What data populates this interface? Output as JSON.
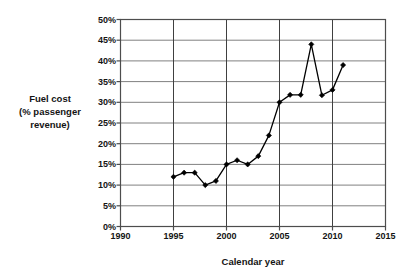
{
  "chart_data": {
    "type": "line",
    "title": "",
    "xlabel": "Calendar year",
    "ylabel": "Fuel cost\n(% passenger\nrevenue)",
    "ylabel_lines": [
      "Fuel cost",
      "(% passenger",
      "revenue)"
    ],
    "xlim": [
      1990,
      2015
    ],
    "ylim": [
      0,
      50
    ],
    "grid": true,
    "legend": "none",
    "x_tick_labels": [
      "1990",
      "1995",
      "2000",
      "2005",
      "2010",
      "2015"
    ],
    "x_ticks": [
      1990,
      1995,
      2000,
      2005,
      2010,
      2015
    ],
    "y_tick_labels": [
      "0%",
      "5%",
      "10%",
      "15%",
      "20%",
      "25%",
      "30%",
      "35%",
      "40%",
      "45%",
      "50%"
    ],
    "y_ticks": [
      0,
      5,
      10,
      15,
      20,
      25,
      30,
      35,
      40,
      45,
      50
    ],
    "y_tick_suffix": "%",
    "series": [
      {
        "name": "Fuel cost (% passenger revenue)",
        "marker": "diamond",
        "color": "#000000",
        "x": [
          1995,
          1996,
          1997,
          1998,
          1999,
          2000,
          2001,
          2002,
          2003,
          2004,
          2005,
          2006,
          2007,
          2008,
          2009,
          2010,
          2011
        ],
        "values": [
          12,
          13,
          13,
          10,
          11,
          15,
          16,
          15,
          17,
          22,
          30,
          31.8,
          31.8,
          44,
          31.7,
          33,
          39
        ]
      }
    ]
  },
  "style": {
    "plot_background": "#ffffff",
    "grid_color": "#808080",
    "axis_color": "#4d4d4d",
    "emphasis_grid_color": "#404040",
    "line_color": "#000000",
    "marker_color": "#000000",
    "text_color": "#141414"
  },
  "icons": {
    "data_marker": "diamond-marker-icon"
  }
}
